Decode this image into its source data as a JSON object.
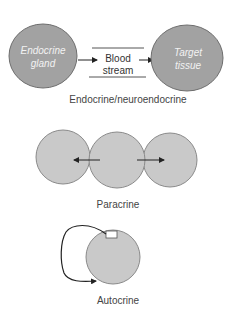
{
  "colors": {
    "endocrine_fill": "#a2a2a2",
    "endocrine_stroke": "#6e6e6e",
    "cell_fill": "#c9c9c9",
    "cell_stroke": "#8a8a8a",
    "arrow": "#222222",
    "caption": "#444444",
    "inner_text": "#f2f2f2"
  },
  "endocrine": {
    "gland_line1": "Endocrine",
    "gland_line2": "gland",
    "blood_line1": "Blood",
    "blood_line2": "stream",
    "target_line1": "Target",
    "target_line2": "tissue",
    "caption": "Endocrine/neuroendocrine"
  },
  "paracrine": {
    "caption": "Paracrine"
  },
  "autocrine": {
    "caption": "Autocrine"
  }
}
